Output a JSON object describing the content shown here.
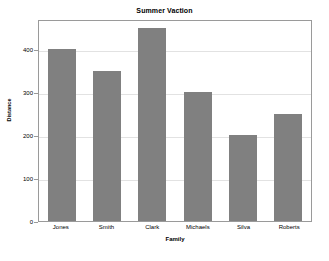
{
  "chart_data": {
    "type": "bar",
    "title": "Summer Vaction",
    "xlabel": "Family",
    "ylabel": "Distance",
    "categories": [
      "Jones",
      "Smith",
      "Clark",
      "Michaels",
      "Silva",
      "Roberts"
    ],
    "values": [
      400,
      350,
      450,
      300,
      200,
      250
    ],
    "yticks": [
      0,
      100,
      200,
      300,
      400
    ],
    "ytick_labels": [
      "0",
      "100",
      "200",
      "300",
      "400"
    ],
    "ylim": [
      0,
      470
    ],
    "grid": true,
    "legend": null,
    "bar_color": "#808080",
    "grid_color": "#e2e2e2",
    "axis_color": "#9a9a9a",
    "background_color": "#ffffff"
  }
}
